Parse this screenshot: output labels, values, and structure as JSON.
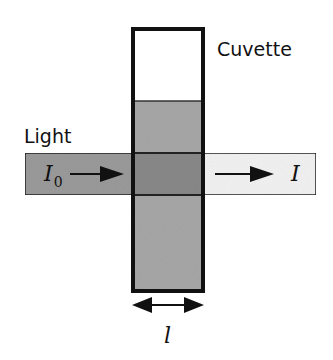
{
  "diagram": {
    "labels": {
      "cuvette": "Cuvette",
      "light": "Light",
      "incident_intensity_symbol": "I",
      "incident_intensity_subscript": "0",
      "transmitted_intensity_symbol": "I",
      "path_length_symbol": "l"
    },
    "colors": {
      "background": "#ffffff",
      "cuvette_outline": "#111111",
      "cuvette_empty": "#ffffff",
      "liquid": "#a9a9a9",
      "overlap": "#8a8a8a",
      "incident_beam": "#9c9c9c",
      "transmitted_beam": "#f4f4f4",
      "arrows": "#111111"
    },
    "elements": [
      {
        "id": "cuvette",
        "type": "rectangle",
        "description": "Vertical cuvette container"
      },
      {
        "id": "liquid",
        "type": "rectangle",
        "description": "Sample solution filling lower part of cuvette"
      },
      {
        "id": "incident-beam",
        "type": "rectangle",
        "description": "Incoming light beam with intensity I0"
      },
      {
        "id": "transmitted-beam",
        "type": "rectangle",
        "description": "Outgoing attenuated light beam with intensity I"
      },
      {
        "id": "path-length-arrow",
        "type": "double-arrow",
        "description": "Path length l across cuvette width"
      }
    ]
  }
}
